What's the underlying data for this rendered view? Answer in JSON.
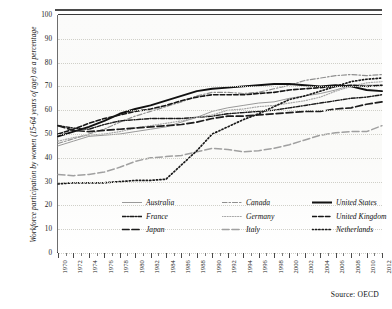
{
  "figure": {
    "title_partial": "",
    "source": "Source: OECD",
    "ylabel": "Workforce participation by women (15-64 years of age) as a percentage"
  },
  "legend": {
    "rows": [
      [
        {
          "label": "Australia",
          "style": "solid-thin-gray",
          "color": "#9a9a9a"
        },
        {
          "label": "Canada",
          "style": "dash-dot-gray",
          "color": "#8f8f8f"
        },
        {
          "label": "United States",
          "style": "solid-thick-black",
          "color": "#111111"
        }
      ],
      [
        {
          "label": "France",
          "style": "dash-dot-black",
          "color": "#1a1a1a"
        },
        {
          "label": "Germany",
          "style": "dotted-gray",
          "color": "#a6a6a6"
        },
        {
          "label": "United Kingdom",
          "style": "dashed-black",
          "color": "#161616"
        }
      ],
      [
        {
          "label": "Japan",
          "style": "long-dash-black",
          "color": "#1c1c1c"
        },
        {
          "label": "Italy",
          "style": "long-dash-gray",
          "color": "#a0a0a0"
        },
        {
          "label": "Netherlands",
          "style": "dotted-black",
          "color": "#1a1a1a"
        }
      ]
    ]
  },
  "chart_data": {
    "type": "line",
    "title": "",
    "xlabel": "",
    "ylabel": "Workforce participation by women (15-64 years of age) as a percentage",
    "xlim": [
      1970,
      2012
    ],
    "ylim": [
      0,
      100
    ],
    "yticks": [
      0,
      10,
      20,
      30,
      40,
      50,
      60,
      70,
      80,
      90,
      100
    ],
    "grid": true,
    "legend_position": "inside-bottom-left",
    "source": "Source: OECD",
    "x": [
      1970,
      1972,
      1974,
      1976,
      1978,
      1980,
      1982,
      1984,
      1986,
      1988,
      1990,
      1992,
      1994,
      1996,
      1998,
      2000,
      2002,
      2004,
      2006,
      2008,
      2010,
      2012
    ],
    "xtick_labels": [
      "1970",
      "1972",
      "1974",
      "1976",
      "1978",
      "1980",
      "1982",
      "1984",
      "1986",
      "1988",
      "1990",
      "1992",
      "1994",
      "1996",
      "1998",
      "2000",
      "2002",
      "2004",
      "2006",
      "2008",
      "2010",
      "2012"
    ],
    "series": [
      {
        "name": "Australia",
        "style": "solid-thin-gray",
        "color": "#9a9a9a",
        "width": 1.0,
        "dash": "none",
        "values": [
          45,
          47,
          49,
          49.5,
          50,
          51,
          52,
          53,
          55,
          57,
          59.5,
          61,
          62,
          63,
          63.5,
          65,
          66,
          67,
          68.5,
          70.5,
          70.5,
          70.5
        ]
      },
      {
        "name": "Canada",
        "style": "dash-dot-gray",
        "color": "#8f8f8f",
        "width": 1.2,
        "dash": "5,2,1.5,2",
        "values": [
          46,
          48,
          50,
          52,
          55,
          57.5,
          59.5,
          61.5,
          63.5,
          66,
          67.5,
          67.5,
          67,
          67.5,
          69,
          70.5,
          72.5,
          73.5,
          74.5,
          75,
          74.5,
          75
        ]
      },
      {
        "name": "United States",
        "style": "solid-thick-black",
        "color": "#111111",
        "width": 1.9,
        "dash": "none",
        "values": [
          49,
          51,
          53,
          55.5,
          58.5,
          60.5,
          62,
          64,
          66,
          68,
          69,
          69.5,
          70,
          70.5,
          71,
          71,
          70.5,
          70,
          70.5,
          70,
          68.5,
          68
        ]
      },
      {
        "name": "France",
        "style": "dash-dot-black",
        "color": "#1a1a1a",
        "width": 1.4,
        "dash": "4,1.5,1,1.5",
        "values": [
          53.5,
          52.5,
          52,
          54,
          55.5,
          56,
          56.5,
          56.5,
          56.5,
          57,
          57.5,
          58.5,
          59,
          59.5,
          60,
          61,
          62,
          63,
          64,
          65,
          65.5,
          66.5
        ]
      },
      {
        "name": "Germany",
        "style": "dotted-gray",
        "color": "#a6a6a6",
        "width": 1.2,
        "dash": "1,1.6",
        "values": [
          47,
          48.5,
          49.5,
          50,
          51,
          52.5,
          53.5,
          54.5,
          55.5,
          57,
          58,
          60,
          60.5,
          61.5,
          62,
          63,
          64,
          65.5,
          68,
          70,
          71.5,
          72
        ]
      },
      {
        "name": "United Kingdom",
        "style": "dashed-black",
        "color": "#161616",
        "width": 1.6,
        "dash": "4.5,2.2",
        "values": [
          50,
          52,
          54.5,
          56.5,
          58,
          59.5,
          60.5,
          62,
          64,
          65.5,
          66.5,
          66.5,
          66.5,
          67,
          67.5,
          68.5,
          69,
          69.5,
          70,
          70.5,
          70,
          70.5
        ]
      },
      {
        "name": "Japan",
        "style": "long-dash-black",
        "color": "#1c1c1c",
        "width": 1.7,
        "dash": "7,3",
        "values": [
          53.5,
          51.5,
          51,
          51.5,
          52,
          52.5,
          53,
          53.5,
          54,
          55,
          56.5,
          57.5,
          57.5,
          58,
          58.5,
          59,
          59.5,
          59.5,
          60.5,
          61,
          62.5,
          63.5
        ]
      },
      {
        "name": "Italy",
        "style": "long-dash-gray",
        "color": "#a0a0a0",
        "width": 1.5,
        "dash": "7,3",
        "values": [
          33,
          32.5,
          33,
          34,
          36,
          38.5,
          40,
          40.5,
          41,
          42.5,
          44,
          43.5,
          42.5,
          43,
          44,
          45.5,
          47.5,
          49.5,
          50.5,
          51,
          51,
          53.5
        ]
      },
      {
        "name": "Netherlands",
        "style": "dotted-black",
        "color": "#1a1a1a",
        "width": 1.7,
        "dash": "1.2,2.2",
        "values": [
          29,
          29.5,
          29.5,
          29.5,
          30,
          30.5,
          30.5,
          31,
          37,
          43,
          50,
          53,
          56,
          58.5,
          61.5,
          64.5,
          66,
          68,
          70,
          72,
          73,
          73.5
        ]
      }
    ]
  }
}
